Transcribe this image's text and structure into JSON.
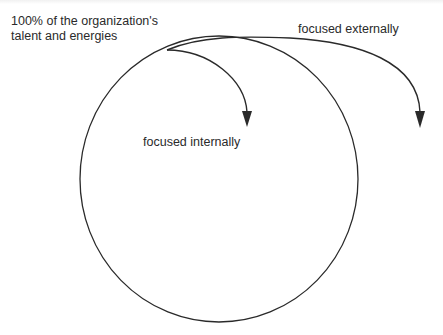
{
  "diagram": {
    "labels": {
      "whole": [
        "100% of the organization's",
        "talent and energies"
      ],
      "external": "focused externally",
      "internal": "focused internally"
    },
    "colors": {
      "stroke": "#2a2a2a",
      "text": "#2a2a2a",
      "background": "#ffffff"
    },
    "shapes": {
      "circle": {
        "cx": 219,
        "cy": 179,
        "rx": 139,
        "ry": 143
      },
      "arrows": [
        {
          "name": "internal",
          "from": [
            167,
            50
          ],
          "to": [
            247,
            126
          ]
        },
        {
          "name": "external",
          "from": [
            237,
            38
          ],
          "to": [
            420,
            127
          ]
        }
      ]
    }
  }
}
